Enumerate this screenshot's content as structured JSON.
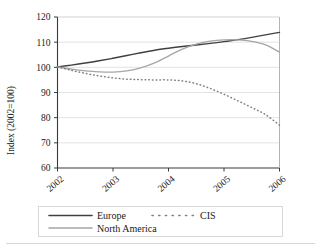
{
  "chart_data": {
    "type": "line",
    "title": "",
    "subtitle": "",
    "xlabel": "",
    "ylabel": "Index (2002=100)",
    "xlim": [
      2002,
      2006
    ],
    "ylim": [
      60,
      120
    ],
    "ytick_labels": [
      "120",
      "110",
      "100",
      "90",
      "80",
      "70",
      "60"
    ],
    "yticks": [
      120,
      110,
      100,
      90,
      80,
      70,
      60
    ],
    "xtick_labels": [
      "2002",
      "2003",
      "2004",
      "2005",
      "2006"
    ],
    "xticks": [
      2002,
      2003,
      2004,
      2005,
      2006
    ],
    "grid": "horizontal",
    "legend_position": "bottom",
    "x": [
      2002,
      2002.25,
      2002.5,
      2002.75,
      2003,
      2003.25,
      2003.5,
      2003.75,
      2004,
      2004.25,
      2004.5,
      2004.75,
      2005,
      2005.25,
      2005.5,
      2005.75,
      2006
    ],
    "series": [
      {
        "name": "Europe",
        "color": "#404040",
        "style": "solid",
        "values": [
          100.2,
          100.9,
          101.7,
          102.6,
          103.6,
          104.7,
          105.8,
          106.8,
          107.6,
          108.3,
          108.9,
          109.5,
          110.2,
          111.0,
          111.9,
          112.9,
          113.9
        ]
      },
      {
        "name": "North America",
        "color": "#a6a6a6",
        "style": "solid",
        "values": [
          100.2,
          99.3,
          98.6,
          98.2,
          98.1,
          98.6,
          99.8,
          101.8,
          104.5,
          107.2,
          109.2,
          110.4,
          110.9,
          110.9,
          110.3,
          108.9,
          106.0
        ]
      },
      {
        "name": "CIS",
        "color": "#808080",
        "style": "dotted",
        "values": [
          100.2,
          98.8,
          97.6,
          96.6,
          95.8,
          95.3,
          95.1,
          95.0,
          95.0,
          94.6,
          93.5,
          91.6,
          89.3,
          86.7,
          84.0,
          81.2,
          77.0
        ]
      }
    ],
    "legend_entries": [
      {
        "label": "Europe",
        "color": "#404040",
        "style": "solid"
      },
      {
        "label": "CIS",
        "color": "#808080",
        "style": "dotted"
      },
      {
        "label": "North America",
        "color": "#a6a6a6",
        "style": "solid"
      }
    ]
  }
}
